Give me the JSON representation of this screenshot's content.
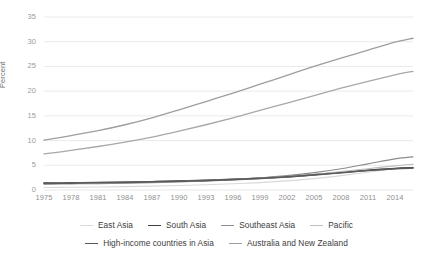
{
  "chart_data": {
    "type": "line",
    "title": "",
    "xlabel": "",
    "ylabel": "Percent",
    "xlim": [
      1975,
      2016
    ],
    "ylim": [
      0,
      35
    ],
    "yticks": [
      0,
      5,
      10,
      15,
      20,
      25,
      30,
      35
    ],
    "xticks": [
      1975,
      1978,
      1981,
      1984,
      1987,
      1990,
      1993,
      1996,
      1999,
      2002,
      2005,
      2008,
      2011,
      2014
    ],
    "grid": true,
    "legend_position": "bottom",
    "x": [
      1975,
      1978,
      1981,
      1984,
      1987,
      1990,
      1993,
      1996,
      1999,
      2002,
      2005,
      2008,
      2011,
      2014,
      2016
    ],
    "series": [
      {
        "name": "East Asia",
        "color": "#d9d9d9",
        "width": 1.1,
        "values": [
          0.5,
          0.55,
          0.6,
          0.68,
          0.78,
          0.9,
          1.05,
          1.25,
          1.5,
          1.85,
          2.3,
          2.9,
          3.6,
          4.3,
          4.6
        ]
      },
      {
        "name": "South Asia",
        "color": "#3f3f3f",
        "width": 1.5,
        "values": [
          1.4,
          1.45,
          1.5,
          1.58,
          1.68,
          1.8,
          1.95,
          2.15,
          2.4,
          2.7,
          3.1,
          3.55,
          4.0,
          4.35,
          4.5
        ]
      },
      {
        "name": "Southeast Asia",
        "color": "#8c8c8c",
        "width": 1.2,
        "values": [
          1.2,
          1.25,
          1.3,
          1.38,
          1.5,
          1.65,
          1.85,
          2.1,
          2.45,
          2.9,
          3.5,
          4.3,
          5.3,
          6.3,
          6.7
        ]
      },
      {
        "name": "Pacific",
        "color": "#bfbfbf",
        "width": 1.2,
        "values": [
          1.3,
          1.35,
          1.42,
          1.5,
          1.6,
          1.72,
          1.88,
          2.08,
          2.35,
          2.7,
          3.15,
          3.7,
          4.3,
          4.9,
          5.2
        ]
      },
      {
        "name": "High-income countries in Asia",
        "color": "#5a5a5a",
        "width": 1.6,
        "values": [
          1.35,
          1.4,
          1.46,
          1.54,
          1.64,
          1.76,
          1.9,
          2.1,
          2.35,
          2.65,
          3.05,
          3.5,
          3.95,
          4.3,
          4.45
        ]
      },
      {
        "name": "Australia and New Zealand",
        "color": "#9e9e9e",
        "width": 1.3,
        "values": [
          10.1,
          11.0,
          12.0,
          13.2,
          14.6,
          16.2,
          17.9,
          19.6,
          21.4,
          23.2,
          25.0,
          26.7,
          28.3,
          29.9,
          30.7
        ]
      }
    ],
    "series_secondary": [
      {
        "name": "High-income countries in Asia (upper)",
        "color": "#a8a8a8",
        "width": 1.3,
        "values": [
          7.3,
          8.0,
          8.8,
          9.7,
          10.7,
          11.9,
          13.2,
          14.6,
          16.1,
          17.6,
          19.1,
          20.6,
          22.0,
          23.3,
          24.0
        ]
      }
    ]
  },
  "axes": {
    "y_title": "Percent",
    "y_tick_labels": [
      "35",
      "30",
      "25",
      "20",
      "15",
      "10",
      "5",
      "0"
    ],
    "x_tick_labels": [
      "1975",
      "1978",
      "1981",
      "1984",
      "1987",
      "1990",
      "1993",
      "1996",
      "1999",
      "2002",
      "2005",
      "2008",
      "2011",
      "2014"
    ]
  },
  "legend": {
    "rows": [
      [
        {
          "label": "East Asia",
          "color": "#d9d9d9",
          "width": "1.4px"
        },
        {
          "label": "South Asia",
          "color": "#3f3f3f",
          "width": "1.8px"
        },
        {
          "label": "Southeast Asia",
          "color": "#8c8c8c",
          "width": "1.5px"
        },
        {
          "label": "Pacific",
          "color": "#bfbfbf",
          "width": "1.5px"
        }
      ],
      [
        {
          "label": "High-income countries in Asia",
          "color": "#5a5a5a",
          "width": "1.8px"
        },
        {
          "label": "Australia and New Zealand",
          "color": "#9e9e9e",
          "width": "1.5px"
        }
      ]
    ]
  },
  "colors": {
    "gridline": "#e8e8e8",
    "tick_text": "#9a9a9a",
    "legend_text": "#3c3c3c",
    "background": "#ffffff"
  }
}
